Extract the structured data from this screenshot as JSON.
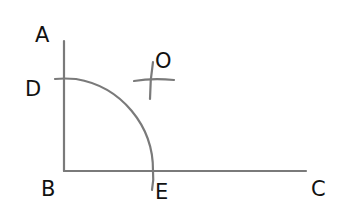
{
  "diagram": {
    "type": "geometric-construction",
    "colors": {
      "line": "#7a7a7a",
      "label": "#111111",
      "background": "#ffffff"
    },
    "labels": {
      "A": "A",
      "B": "B",
      "C": "C",
      "D": "D",
      "E": "E",
      "O": "O"
    },
    "segments": [
      {
        "name": "BA",
        "from": "B",
        "to": "A"
      },
      {
        "name": "BC",
        "from": "B",
        "to": "C"
      }
    ],
    "arcs": [
      {
        "name": "arc-DE",
        "center": "B",
        "from": "D",
        "to": "E"
      },
      {
        "name": "construction-arc-from-D",
        "near": "O"
      },
      {
        "name": "construction-arc-from-E",
        "near": "O"
      }
    ]
  }
}
